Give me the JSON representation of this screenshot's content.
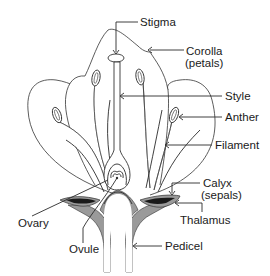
{
  "diagram": {
    "type": "labeled-biology-diagram",
    "colors": {
      "background": "#ffffff",
      "line": "#2a2a2a",
      "pedicel_fill": "#9a9a9a",
      "sepal_dark": "#1a1a1a",
      "text": "#1a1a1a"
    },
    "labels": {
      "stigma": "Stigma",
      "corolla_line1": "Corolla",
      "corolla_line2": "(petals)",
      "style": "Style",
      "anther": "Anther",
      "filament": "Filament",
      "calyx_line1": "Calyx",
      "calyx_line2": "(sepals)",
      "ovary": "Ovary",
      "thalamus": "Thalamus",
      "ovule": "Ovule",
      "pedicel": "Pedicel"
    }
  }
}
